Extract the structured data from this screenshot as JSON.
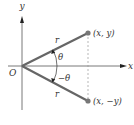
{
  "diagram": {
    "title": "",
    "colors": {
      "axis": "#555555",
      "ray": "#666666",
      "point": "#777777",
      "dashed": "#999999",
      "text": "#333333"
    },
    "axes": {
      "x_label": "x",
      "y_label": "y",
      "origin_label": "O"
    },
    "points": [
      {
        "id": "upper",
        "label": "(x, y)"
      },
      {
        "id": "lower",
        "label": "(x, −y)"
      }
    ],
    "rays": [
      {
        "id": "upper-ray",
        "length_label": "r"
      },
      {
        "id": "lower-ray",
        "length_label": "r"
      }
    ],
    "angles": [
      {
        "id": "positive-angle",
        "label": "θ"
      },
      {
        "id": "negative-angle",
        "label": "−θ"
      }
    ]
  }
}
